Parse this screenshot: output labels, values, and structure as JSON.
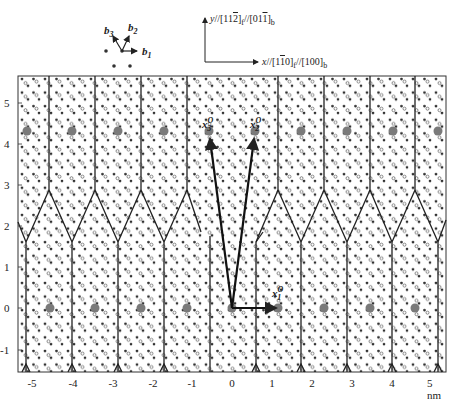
{
  "figure": {
    "type": "atomic interface structure diagram",
    "basis_legend": {
      "vectors": [
        "b1",
        "b2",
        "b3"
      ],
      "labels": {
        "b1": "b",
        "b1_sub": "1",
        "b2": "b",
        "b2_sub": "2",
        "b3": "b",
        "b3_sub": "3"
      }
    },
    "axes_legend": {
      "y_label": "y//[11̅2]f//[011̅]b",
      "y_label_parts": {
        "prefix": "y//[11",
        "bar": "2",
        "mid": "]",
        "sub1": "f",
        "mid2": "//[01",
        "bar2": "1",
        "end": "]",
        "sub2": "b"
      },
      "x_label": "x//[11̅0]f//[100]b",
      "x_label_parts": {
        "prefix": "x//[1",
        "bar": "1",
        "mid": "0]",
        "sub1": "f",
        "mid2": "//[100]",
        "sub2": "b"
      }
    },
    "x_axis": {
      "ticks": [
        "-5",
        "-4",
        "-3",
        "-2",
        "-1",
        "0",
        "1",
        "2",
        "3",
        "4",
        "5 nm"
      ],
      "range": [
        -5.3,
        5.5
      ],
      "unit": "nm"
    },
    "y_axis": {
      "ticks": [
        "5",
        "4",
        "3",
        "2",
        "1",
        "0",
        "-1"
      ],
      "range": [
        -1.6,
        5.6
      ],
      "unit": "nm"
    },
    "vectors": [
      {
        "name": "x1",
        "label": "x",
        "sub": "1",
        "sup": "O",
        "from": [
          0,
          0
        ],
        "to": [
          1.1,
          0
        ]
      },
      {
        "name": "x2",
        "label": "x",
        "sub": "2",
        "sup": "O",
        "from": [
          0,
          0
        ],
        "to": [
          0.55,
          4.1
        ]
      },
      {
        "name": "x3",
        "label": "x",
        "sub": "3",
        "sup": "O",
        "from": [
          0,
          0
        ],
        "to": [
          -0.55,
          4.1
        ]
      }
    ],
    "large_atoms_y": [
      0,
      4.1
    ],
    "boundary": "zigzag misfit dislocation network, period ~1.1 nm"
  }
}
